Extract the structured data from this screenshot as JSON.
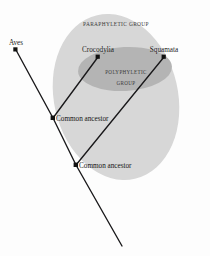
{
  "figure": {
    "background_color": "#fdfdfd"
  },
  "groups": {
    "outer": {
      "label": "PARAPHYLETIC GROUP",
      "color": "#d7d7d7",
      "shape": "ellipse"
    },
    "inner": {
      "label_line1": "POLYPHYLETIC",
      "label_line2": "GROUP",
      "color": "#b4b4b4",
      "shape": "ellipse"
    }
  },
  "taxa": [
    {
      "name": "Aves",
      "x": 16,
      "y": 50
    },
    {
      "name": "Crocodylia",
      "x": 98,
      "y": 57
    },
    {
      "name": "Squamata",
      "x": 164,
      "y": 57
    }
  ],
  "nodes": [
    {
      "name": "Common ancestor",
      "x": 53,
      "y": 118
    },
    {
      "name": "Common ancestor",
      "x": 76,
      "y": 165
    }
  ],
  "labels": {
    "aves": "Aves",
    "crocodylia": "Crocodylia",
    "squamata": "Squamata",
    "ancestor_upper": "Common ancestor",
    "ancestor_lower": "Common ancestor"
  },
  "colors": {
    "branch": "#19181a",
    "node": "#111111",
    "text": "#1d1d1d",
    "group_text": "#3a3a3a"
  }
}
